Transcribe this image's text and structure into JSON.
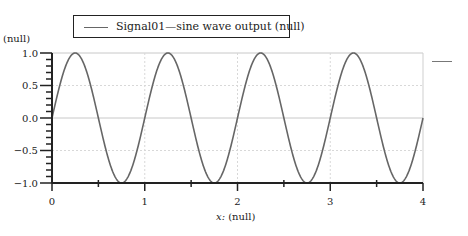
{
  "legend": {
    "entries": [
      {
        "label": "Signal01—sine wave output (null)",
        "color": "#666666"
      }
    ]
  },
  "axes": {
    "y_label": "(null)",
    "x_label_var": "x:",
    "x_label_unit": "(null)"
  },
  "chart_data": {
    "type": "line",
    "title": "",
    "xlabel": "x: (null)",
    "ylabel": "(null)",
    "xlim": [
      0,
      4
    ],
    "ylim": [
      -1.0,
      1.0
    ],
    "x_ticks": [
      0,
      1,
      2,
      3,
      4
    ],
    "y_ticks": [
      -1.0,
      -0.5,
      0.0,
      0.5,
      1.0
    ],
    "x_tick_labels": [
      "0",
      "1",
      "2",
      "3",
      "4"
    ],
    "y_tick_labels": [
      "−1.0",
      "−0.5",
      "0.0",
      "0.5",
      "1.0"
    ],
    "grid": true,
    "legend_position": "top",
    "series": [
      {
        "name": "Signal01—sine wave output (null)",
        "function": "sin(2*pi*x)",
        "amplitude": 1.0,
        "frequency": 1.0,
        "x": [
          0,
          0.25,
          0.5,
          0.75,
          1.0,
          1.25,
          1.5,
          1.75,
          2.0,
          2.25,
          2.5,
          2.75,
          3.0,
          3.25,
          3.5,
          3.75,
          4.0
        ],
        "values": [
          0,
          1,
          0,
          -1,
          0,
          1,
          0,
          -1,
          0,
          1,
          0,
          -1,
          0,
          1,
          0,
          -1,
          0
        ],
        "color": "#666666"
      }
    ]
  }
}
